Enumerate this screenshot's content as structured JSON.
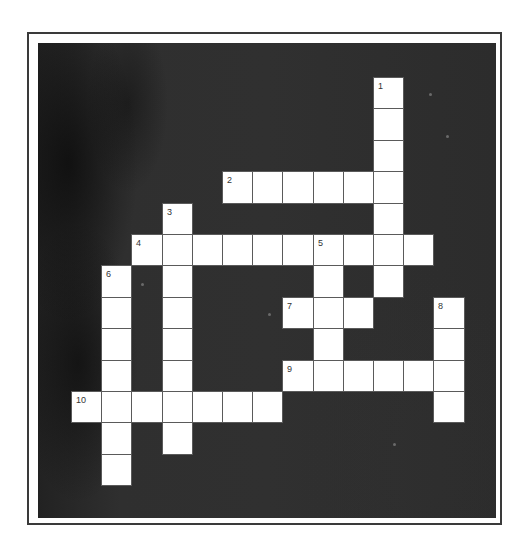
{
  "puzzle": {
    "type": "crossword",
    "grid": {
      "rows": 13,
      "cols": 13,
      "origin_x": 33,
      "origin_y": 34,
      "cell_w": 30.2,
      "cell_h": 31.4
    },
    "colors": {
      "board": "#2e2e2e",
      "cell": "#ffffff",
      "cell_border": "#5a5a5a",
      "number": "#333333",
      "frame": "#3a3a3a"
    },
    "entries": [
      {
        "number": "1",
        "direction": "down",
        "row": 0,
        "col": 10,
        "length": 7
      },
      {
        "number": "2",
        "direction": "across",
        "row": 3,
        "col": 5,
        "length": 6
      },
      {
        "number": "3",
        "direction": "down",
        "row": 4,
        "col": 3,
        "length": 8
      },
      {
        "number": "4",
        "direction": "across",
        "row": 5,
        "col": 2,
        "length": 10
      },
      {
        "number": "5",
        "direction": "down",
        "row": 5,
        "col": 8,
        "length": 5
      },
      {
        "number": "6",
        "direction": "down",
        "row": 6,
        "col": 1,
        "length": 7
      },
      {
        "number": "7",
        "direction": "across",
        "row": 7,
        "col": 7,
        "length": 3
      },
      {
        "number": "8",
        "direction": "down",
        "row": 7,
        "col": 12,
        "length": 4
      },
      {
        "number": "9",
        "direction": "across",
        "row": 9,
        "col": 7,
        "length": 6
      },
      {
        "number": "10",
        "direction": "across",
        "row": 10,
        "col": 0,
        "length": 7
      }
    ]
  }
}
